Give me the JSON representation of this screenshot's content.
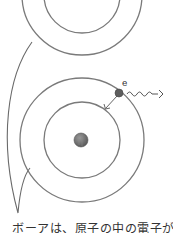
{
  "diagram": {
    "colors": {
      "orbit": "#7a7a7a",
      "nucleus": "#6e6e6e",
      "electron": "#5e5e5e",
      "bubble": "#6a6a6a",
      "text": "#333333"
    },
    "top_atom": {
      "center": [
        82,
        -5
      ],
      "orbits": [
        38,
        60
      ]
    },
    "bottom_atom": {
      "center": [
        82,
        140
      ],
      "nucleus_radius": 7,
      "orbits": [
        38,
        62
      ],
      "electron": {
        "label": "e",
        "position": [
          119,
          93
        ]
      },
      "transition_arrow": {
        "from": "outer-orbit",
        "to": "inner-orbit"
      },
      "photon": {
        "direction": "right",
        "shape": "wavy-arrow"
      }
    },
    "caption": "ボーアは、原子の中の電子がエネ"
  }
}
